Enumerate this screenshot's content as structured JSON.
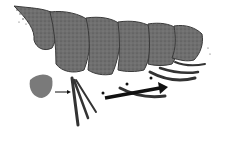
{
  "figure": {
    "colors": {
      "background": "#ffffff",
      "body": "#6e6e6e",
      "outline": "#3a3a3a",
      "arrow": "#111111"
    },
    "annotations": {
      "arrows": [
        {
          "name": "large-arrow",
          "from": [
            105,
            98
          ],
          "to": [
            162,
            88
          ]
        },
        {
          "name": "small-arrow-left",
          "from": [
            55,
            92
          ],
          "to": [
            70,
            92
          ]
        },
        {
          "name": "small-arrow-mid",
          "from": [
            125,
            85
          ],
          "to": [
            118,
            85
          ]
        }
      ],
      "markers": [
        {
          "name": "dot-marker-1",
          "x": 103,
          "y": 93
        },
        {
          "name": "dot-marker-2",
          "x": 127,
          "y": 84
        },
        {
          "name": "dot-marker-3",
          "x": 151,
          "y": 78
        }
      ]
    }
  }
}
